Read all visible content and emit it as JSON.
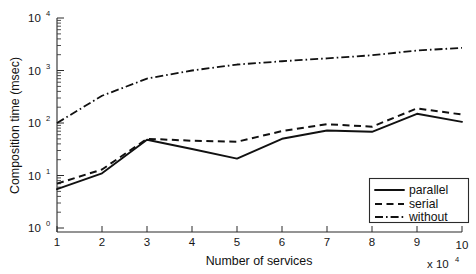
{
  "chart_data": {
    "type": "line",
    "title": "",
    "xlabel": "Number of services",
    "ylabel": "Composition time (msec)",
    "x_axis_multiplier": "x 10",
    "x_axis_multiplier_exponent": "4",
    "yscale": "log",
    "xscale": "linear",
    "xlim": [
      1,
      10
    ],
    "ylim": [
      1,
      10000
    ],
    "grid": false,
    "legend_position": "bottom-right",
    "x_ticklabels": [
      "1",
      "2",
      "3",
      "4",
      "5",
      "6",
      "7",
      "8",
      "9",
      "10"
    ],
    "x": [
      1,
      2,
      3,
      4,
      5,
      6,
      7,
      8,
      9,
      10
    ],
    "y_tick_bases": [
      "10",
      "10",
      "10",
      "10",
      "10"
    ],
    "y_tick_exponents": [
      "0",
      "1",
      "2",
      "3",
      "4"
    ],
    "y_tickvalues": [
      1,
      10,
      100,
      1000,
      10000
    ],
    "series": [
      {
        "name": "parallel",
        "style": "solid",
        "values": [
          5.5,
          11,
          48,
          32,
          21,
          50,
          72,
          68,
          150,
          105
        ]
      },
      {
        "name": "serial",
        "style": "dashed",
        "values": [
          7,
          13,
          50,
          46,
          44,
          70,
          95,
          85,
          190,
          145
        ]
      },
      {
        "name": "without",
        "style": "dash-dot",
        "values": [
          100,
          330,
          700,
          1000,
          1300,
          1500,
          1700,
          1950,
          2400,
          2700
        ]
      }
    ]
  },
  "legend": {
    "items": [
      {
        "label": "parallel"
      },
      {
        "label": "serial"
      },
      {
        "label": "without"
      }
    ]
  },
  "colors": {
    "ink": "#111111",
    "axis": "#2b2b2b",
    "background": "#ffffff"
  }
}
